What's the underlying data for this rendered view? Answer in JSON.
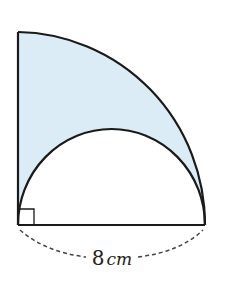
{
  "diagram": {
    "type": "geometry-figure",
    "shapes": {
      "quarter_circle": {
        "radius_label": "8cm"
      },
      "semicircle": {
        "diameter_label": "8cm"
      },
      "right_angle_marker": true
    },
    "dimension": {
      "value": "8",
      "unit": "cm"
    },
    "colors": {
      "shaded_fill": "#dcecf7",
      "stroke": "#1a1a1a",
      "dashed": "#444444"
    }
  }
}
